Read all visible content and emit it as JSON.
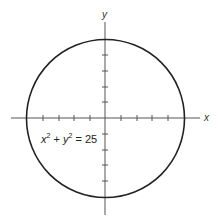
{
  "diagram": {
    "x_axis_label": "x",
    "y_axis_label": "y",
    "equation": {
      "var1": "x",
      "exp1": "2",
      "plus": " + ",
      "var2": "y",
      "exp2": "2",
      "equals": " = 25"
    },
    "circle": {
      "center": [
        0,
        0
      ],
      "radius": 5
    },
    "ticks_per_half_axis": 5,
    "colors": {
      "stroke": "#222222",
      "axis": "#555555"
    }
  }
}
